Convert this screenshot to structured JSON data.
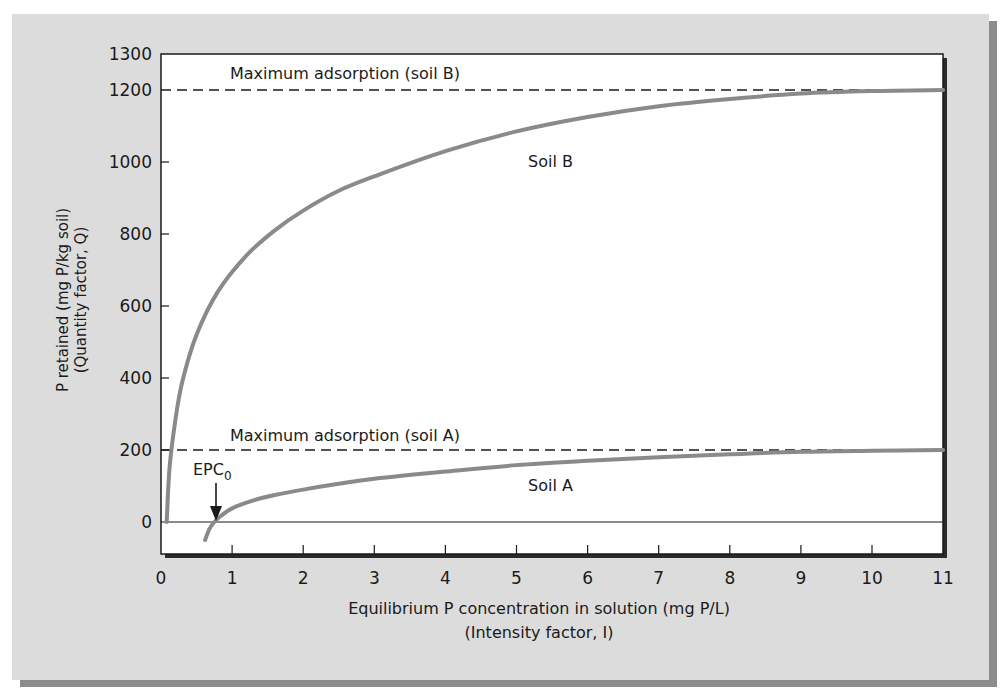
{
  "chart_data": {
    "type": "line",
    "title": "",
    "xlabel": "Equilibrium P concentration in solution (mg P/L)",
    "xlabel_line2": "(Intensity factor, I)",
    "ylabel": "P retained (mg P/kg soil)",
    "ylabel_line2": "(Quantity factor, Q)",
    "xlim": [
      0,
      11
    ],
    "ylim": [
      -100,
      1300
    ],
    "x_ticks": [
      0,
      1,
      2,
      3,
      4,
      5,
      6,
      7,
      8,
      9,
      10,
      11
    ],
    "y_ticks": [
      0,
      200,
      400,
      600,
      800,
      1000,
      1200,
      1300
    ],
    "grid": false,
    "legend": null,
    "series": [
      {
        "name": "Soil B",
        "color": "#8a8a8a",
        "x": [
          0.08,
          0.12,
          0.2,
          0.3,
          0.5,
          0.8,
          1.2,
          1.6,
          2.0,
          2.5,
          3.0,
          4.0,
          5.0,
          6.0,
          7.0,
          8.0,
          9.0,
          10.0,
          11.0
        ],
        "y": [
          0,
          150,
          280,
          390,
          520,
          640,
          740,
          810,
          865,
          920,
          960,
          1030,
          1085,
          1125,
          1155,
          1175,
          1190,
          1197,
          1200
        ]
      },
      {
        "name": "Soil A",
        "color": "#8a8a8a",
        "x": [
          0.62,
          0.68,
          0.75,
          0.85,
          1.0,
          1.3,
          1.6,
          2.0,
          2.5,
          3.0,
          4.0,
          5.0,
          6.0,
          7.0,
          8.0,
          9.0,
          10.0,
          11.0
        ],
        "y": [
          -50,
          -20,
          0,
          18,
          38,
          60,
          75,
          90,
          106,
          120,
          140,
          158,
          170,
          180,
          188,
          195,
          198,
          200
        ]
      }
    ],
    "reference_lines": [
      {
        "label": "Maximum adsorption (soil B)",
        "y": 1200,
        "style": "dashed"
      },
      {
        "label": "Maximum adsorption (soil A)",
        "y": 200,
        "style": "dashed"
      },
      {
        "label": "",
        "y": 0,
        "style": "solid"
      }
    ],
    "annotations": [
      {
        "text": "Soil B",
        "x": 5.4,
        "y": 1000
      },
      {
        "text": "Soil A",
        "x": 5.4,
        "y": 100
      },
      {
        "text": "EPC",
        "subscript": "0",
        "x": 0.75,
        "y": 0,
        "arrow": true
      }
    ]
  },
  "labels": {
    "max_b": "Maximum adsorption (soil B)",
    "max_a": "Maximum adsorption (soil A)",
    "soil_b": "Soil B",
    "soil_a": "Soil A",
    "epc": "EPC",
    "epc_sub": "0"
  },
  "colors": {
    "panel_bg": "#dcdcdc",
    "panel_shadow": "#8c8c8c",
    "plot_bg": "#ffffff",
    "axis": "#1a1a1a",
    "curve": "#8a8a8a"
  }
}
